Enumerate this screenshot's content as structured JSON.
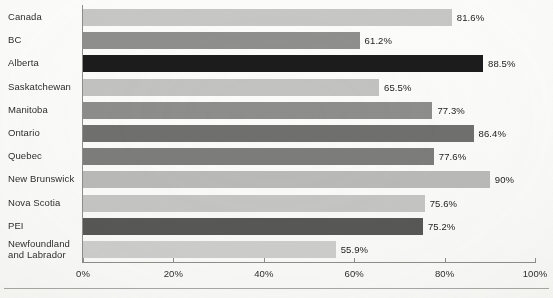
{
  "chart_data": {
    "type": "bar",
    "orientation": "horizontal",
    "title": "",
    "xlabel": "",
    "ylabel": "",
    "xlim": [
      0,
      100
    ],
    "grid": false,
    "legend": null,
    "unit": "%",
    "categories": [
      "Canada",
      "BC",
      "Alberta",
      "Saskatchewan",
      "Manitoba",
      "Ontario",
      "Quebec",
      "New Brunswick",
      "Nova Scotia",
      "PEI",
      "Newfoundland and Labrador"
    ],
    "values": [
      81.6,
      61.2,
      88.5,
      65.5,
      77.3,
      86.4,
      77.6,
      90,
      75.6,
      75.2,
      55.9
    ],
    "value_labels": [
      "81.6%",
      "61.2%",
      "88.5%",
      "65.5%",
      "77.3%",
      "86.4%",
      "77.6%",
      "90%",
      "75.6%",
      "75.2%",
      "55.9%"
    ],
    "bar_colors": [
      "#c7c7c5",
      "#8f8f8d",
      "#1c1c1c",
      "#c2c2c0",
      "#8d8d8b",
      "#6f6f6d",
      "#7c7c7a",
      "#b9b9b7",
      "#c4c4c2",
      "#575755",
      "#cccccb"
    ],
    "xticks": [
      0,
      20,
      40,
      60,
      80,
      100
    ],
    "xtick_labels": [
      "0%",
      "20%",
      "40%",
      "60%",
      "80%",
      "100%"
    ]
  },
  "axis": {
    "tick_labels": [
      "0%",
      "20%",
      "40%",
      "60%",
      "80%",
      "100%"
    ]
  }
}
